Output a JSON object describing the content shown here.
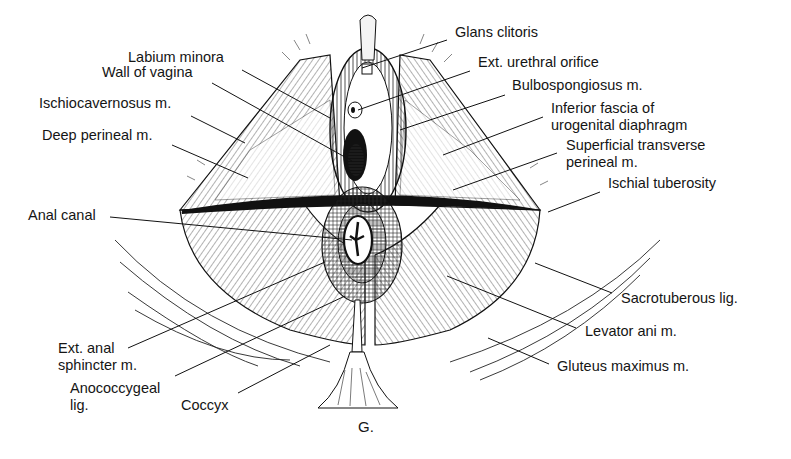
{
  "figure": {
    "caption": "G.",
    "background": "#ffffff",
    "ink": "#111111"
  },
  "labels": [
    {
      "id": "glans-clitoris",
      "line1": "Glans clitoris",
      "line2": "",
      "x": 455,
      "y": 24,
      "leader": [
        [
          447,
          40
        ],
        [
          362,
          68
        ]
      ]
    },
    {
      "id": "labium-minora",
      "line1": "Labium minora",
      "line2": "",
      "x": 128,
      "y": 49,
      "leader": [
        [
          242,
          70
        ],
        [
          330,
          118
        ]
      ]
    },
    {
      "id": "wall-of-vagina",
      "line1": "Wall of vagina",
      "line2": "",
      "x": 102,
      "y": 64,
      "leader": [
        [
          212,
          83
        ],
        [
          352,
          161
        ]
      ]
    },
    {
      "id": "ext-urethral-orifice",
      "line1": "Ext. urethral orifice",
      "line2": "",
      "x": 478,
      "y": 54,
      "leader": [
        [
          470,
          71
        ],
        [
          358,
          110
        ]
      ]
    },
    {
      "id": "bulbospongiosus",
      "line1": "Bulbospongiosus m.",
      "line2": "",
      "x": 512,
      "y": 77,
      "leader": [
        [
          505,
          95
        ],
        [
          400,
          130
        ]
      ]
    },
    {
      "id": "ischiocavernosus",
      "line1": "Ischiocavernosus m.",
      "line2": "",
      "x": 39,
      "y": 95,
      "leader": [
        [
          191,
          116
        ],
        [
          245,
          143
        ]
      ]
    },
    {
      "id": "inferior-fascia",
      "line1": "Inferior fascia of",
      "line2": "urogenital diaphragm",
      "x": 551,
      "y": 100,
      "leader": [
        [
          543,
          117
        ],
        [
          443,
          155
        ]
      ]
    },
    {
      "id": "deep-perineal",
      "line1": "Deep perineal m.",
      "line2": "",
      "x": 42,
      "y": 127,
      "leader": [
        [
          172,
          145
        ],
        [
          248,
          178
        ]
      ]
    },
    {
      "id": "superficial-transverse",
      "line1": "Superficial transverse",
      "line2": "perineal m.",
      "x": 566,
      "y": 137,
      "leader": [
        [
          557,
          153
        ],
        [
          453,
          190
        ]
      ]
    },
    {
      "id": "ischial-tuberosity",
      "line1": "Ischial tuberosity",
      "line2": "",
      "x": 608,
      "y": 175,
      "leader": [
        [
          600,
          192
        ],
        [
          548,
          212
        ]
      ]
    },
    {
      "id": "anal-canal",
      "line1": "Anal canal",
      "line2": "",
      "x": 28,
      "y": 207,
      "leader": [
        [
          110,
          217
        ],
        [
          352,
          240
        ]
      ]
    },
    {
      "id": "sacrotuberous",
      "line1": "Sacrotuberous lig.",
      "line2": "",
      "x": 621,
      "y": 290,
      "leader": [
        [
          612,
          293
        ],
        [
          535,
          263
        ]
      ]
    },
    {
      "id": "levator-ani",
      "line1": "Levator ani m.",
      "line2": "",
      "x": 585,
      "y": 323,
      "leader": [
        [
          576,
          328
        ],
        [
          447,
          276
        ]
      ]
    },
    {
      "id": "gluteus-maximus",
      "line1": "Gluteus maximus m.",
      "line2": "",
      "x": 557,
      "y": 358,
      "leader": [
        [
          549,
          364
        ],
        [
          488,
          338
        ]
      ]
    },
    {
      "id": "ext-anal-sphincter",
      "line1": "Ext. anal",
      "line2": "sphincter m.",
      "x": 58,
      "y": 340,
      "leader": [
        [
          128,
          348
        ],
        [
          325,
          262
        ]
      ]
    },
    {
      "id": "anococcygeal",
      "line1": "Anococcygeal",
      "line2": "lig.",
      "x": 70,
      "y": 380,
      "leader": [
        [
          175,
          376
        ],
        [
          345,
          296
        ]
      ]
    },
    {
      "id": "coccyx",
      "line1": "Coccyx",
      "line2": "",
      "x": 181,
      "y": 397,
      "leader": [
        [
          238,
          393
        ],
        [
          330,
          345
        ]
      ]
    }
  ],
  "caption_position": {
    "x": 358,
    "y": 418
  }
}
